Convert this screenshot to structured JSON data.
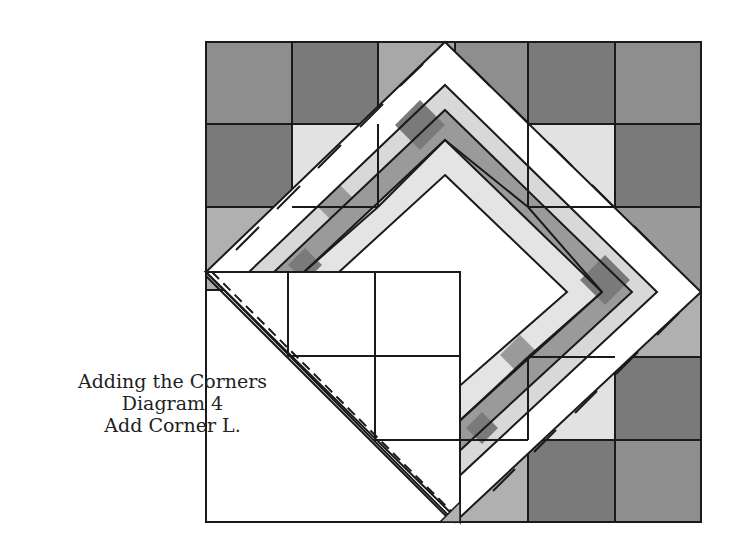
{
  "caption": {
    "line1": "Adding the Corners",
    "line2": "Diagram 4",
    "line3": "Add Corner L."
  },
  "colors": {
    "dark": "#747474",
    "medium": "#9a9a9a",
    "light": "#c4c4c4",
    "pale": "#e6e6e6",
    "white": "#ffffff",
    "line": "#1a1a1a"
  },
  "diagram": {
    "corner_label": "Corner L",
    "seam": "dashed"
  }
}
